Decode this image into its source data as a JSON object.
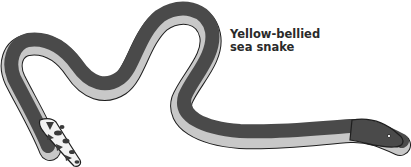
{
  "caption": {
    "line1": "Yellow-bellied",
    "line2": "sea snake"
  },
  "illustration": {
    "subject": "snake-illustration",
    "colors": {
      "dorsal": "#4a4a4a",
      "belly": "#c8c8c8",
      "outline": "#1e1e1e",
      "tail_pattern_light": "#f2f2f2",
      "tail_pattern_dark": "#3a3a3a",
      "background": "#ffffff",
      "text": "#2a2a2a"
    }
  }
}
